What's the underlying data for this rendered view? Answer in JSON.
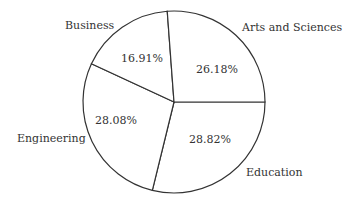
{
  "chart_data": {
    "type": "pie",
    "title": "",
    "categories": [
      "Education",
      "Engineering",
      "Business",
      "Arts and Sciences"
    ],
    "values": [
      28.82,
      28.08,
      16.91,
      26.18
    ],
    "value_labels": [
      "28.82%",
      "28.08%",
      "16.91%",
      "26.18%"
    ],
    "start_angle_deg": 0,
    "direction": "clockwise",
    "legend": "none (labels outside slices)"
  },
  "labels": {
    "arts": "Arts and Sciences",
    "business": "Business",
    "engineering": "Engineering",
    "education": "Education",
    "arts_pct": "26.18%",
    "business_pct": "16.91%",
    "engineering_pct": "28.08%",
    "education_pct": "28.82%"
  }
}
